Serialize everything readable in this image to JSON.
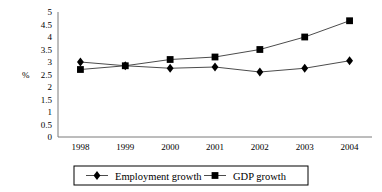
{
  "chart_data": {
    "type": "line",
    "title": "",
    "subtitle": "",
    "xlabel": "",
    "ylabel": "%",
    "categories": [
      "1998",
      "1999",
      "2000",
      "2001",
      "2002",
      "2003",
      "2004"
    ],
    "x": [
      1998,
      1999,
      2000,
      2001,
      2002,
      2003,
      2004
    ],
    "ylim": [
      0,
      5
    ],
    "yticks": [
      "0",
      "0.5",
      "1",
      "1.5",
      "2",
      "2.5",
      "3",
      "3.5",
      "4",
      "4.5",
      "5"
    ],
    "ytick_values": [
      0,
      0.5,
      1,
      1.5,
      2,
      2.5,
      3,
      3.5,
      4,
      4.5,
      5
    ],
    "grid": false,
    "legend_position": "bottom",
    "series": [
      {
        "name": "Employment growth",
        "marker": "diamond",
        "values": [
          3.0,
          2.85,
          2.75,
          2.8,
          2.6,
          2.75,
          3.05
        ]
      },
      {
        "name": "GDP growth",
        "marker": "square",
        "values": [
          2.7,
          2.85,
          3.1,
          3.2,
          3.5,
          4.0,
          4.65
        ]
      }
    ]
  },
  "legend": {
    "items": [
      {
        "label": "Employment growth",
        "marker": "diamond"
      },
      {
        "label": "GDP growth",
        "marker": "square"
      }
    ]
  }
}
